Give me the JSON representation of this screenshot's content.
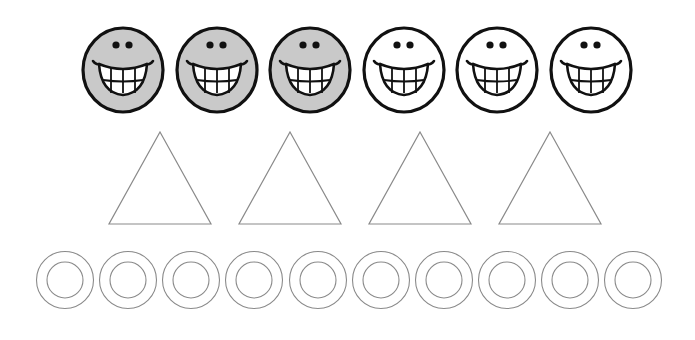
{
  "worksheet": {
    "description": "Counting / fraction worksheet: smiley faces, triangles and rings",
    "colors": {
      "background": "#ffffff",
      "smiley_fill_shaded": "#c9c9c9",
      "smiley_fill_unshaded": "#ffffff",
      "smiley_stroke": "#111111",
      "shape_stroke": "#8a8a8a"
    },
    "smileys": {
      "row_label": "Smiley faces row",
      "center_y": 70,
      "radius": 40,
      "items": [
        {
          "cx": 123,
          "shaded": true
        },
        {
          "cx": 217,
          "shaded": true
        },
        {
          "cx": 310,
          "shaded": true
        },
        {
          "cx": 404,
          "shaded": false
        },
        {
          "cx": 497,
          "shaded": false
        },
        {
          "cx": 591,
          "shaded": false
        }
      ],
      "shaded_count": 3,
      "total_count": 6
    },
    "triangles": {
      "row_label": "Triangles row",
      "apex_y": 132,
      "base_y": 224,
      "half_width": 51,
      "items": [
        {
          "cx": 160,
          "shaded": false
        },
        {
          "cx": 290,
          "shaded": false
        },
        {
          "cx": 420,
          "shaded": false
        },
        {
          "cx": 550,
          "shaded": false
        }
      ],
      "total_count": 4
    },
    "rings": {
      "row_label": "Rings row",
      "center_y": 280,
      "outer_radius": 28.5,
      "inner_radius": 18,
      "items": [
        {
          "cx": 65
        },
        {
          "cx": 128
        },
        {
          "cx": 191
        },
        {
          "cx": 254
        },
        {
          "cx": 318
        },
        {
          "cx": 381
        },
        {
          "cx": 444
        },
        {
          "cx": 507
        },
        {
          "cx": 570
        },
        {
          "cx": 633
        }
      ],
      "total_count": 10
    }
  }
}
